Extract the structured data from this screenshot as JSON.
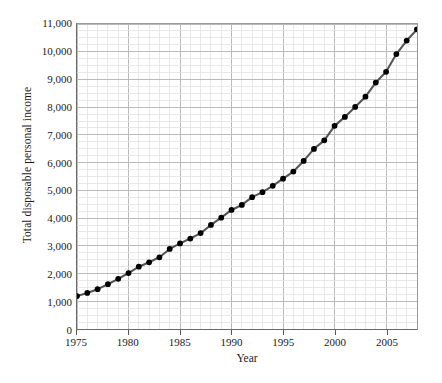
{
  "chart_data": {
    "type": "line",
    "title": "",
    "xlabel": "Year",
    "ylabel": "Total disposable personal income",
    "xlim": [
      1975,
      2008
    ],
    "ylim": [
      0,
      11000
    ],
    "grid": true,
    "legend": false,
    "marker": "filled-circle",
    "line_color": "#555555",
    "marker_color": "#000000",
    "y_ticks": [
      0,
      1000,
      2000,
      3000,
      4000,
      5000,
      6000,
      7000,
      8000,
      9000,
      10000,
      11000
    ],
    "y_tick_labels": [
      "0",
      "1,000",
      "2,000",
      "3,000",
      "4,000",
      "5,000",
      "6,000",
      "7,000",
      "8,000",
      "9,000",
      "10,000",
      "11,000"
    ],
    "x_ticks": [
      1975,
      1980,
      1985,
      1990,
      1995,
      2000,
      2005
    ],
    "x_tick_labels": [
      "1975",
      "1980",
      "1985",
      "1990",
      "1995",
      "2000",
      "2005"
    ],
    "x_minor_step": 1,
    "y_minor_step": 250,
    "x": [
      1975,
      1976,
      1977,
      1978,
      1979,
      1980,
      1981,
      1982,
      1983,
      1984,
      1985,
      1986,
      1987,
      1988,
      1989,
      1990,
      1991,
      1992,
      1993,
      1994,
      1995,
      1996,
      1997,
      1998,
      1999,
      2000,
      2001,
      2002,
      2003,
      2004,
      2005,
      2006,
      2007,
      2008
    ],
    "values": [
      1187,
      1302,
      1436,
      1614,
      1808,
      2019,
      2248,
      2406,
      2586,
      2887,
      3086,
      3262,
      3459,
      3752,
      4016,
      4294,
      4474,
      4755,
      4935,
      5165,
      5422,
      5678,
      6061,
      6495,
      6803,
      7327,
      7649,
      8010,
      8378,
      8889,
      9277,
      9916,
      10404,
      10806
    ],
    "units_note": "billions of dollars"
  },
  "axis": {
    "y_title": "Total disposable personal income",
    "x_title": "Year"
  }
}
